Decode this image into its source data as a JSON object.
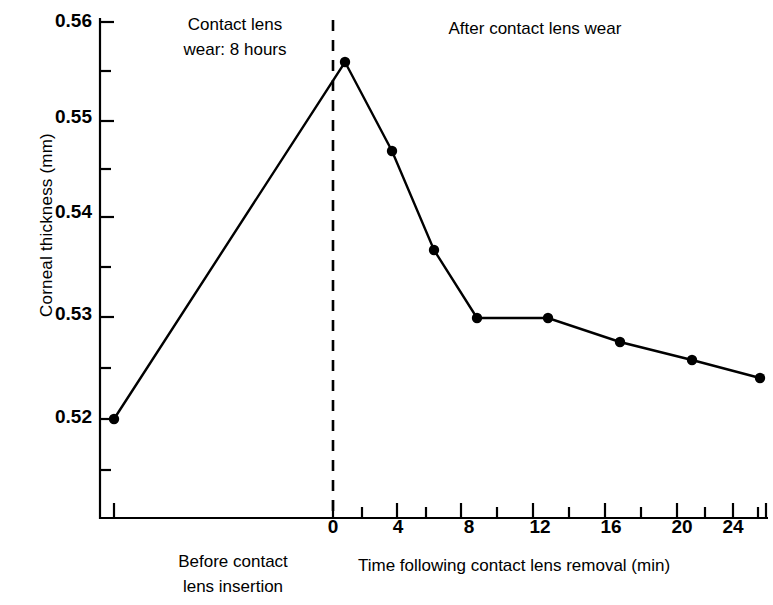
{
  "chart_data": {
    "type": "line",
    "title": "",
    "xlabel": "Time following contact lens removal (min)",
    "ylabel": "Corneal thickness (mm)",
    "xlim": [
      -14,
      30
    ],
    "ylim": [
      0.5145,
      0.5605
    ],
    "grid": false,
    "legend": null,
    "x_ticks": [
      0,
      2,
      4,
      6,
      8,
      10,
      12,
      14,
      16,
      18,
      20,
      22,
      24,
      26,
      28,
      30
    ],
    "x_tick_labels": [
      "0",
      "",
      "4",
      "",
      "8",
      "",
      "12",
      "",
      "16",
      "",
      "20",
      "",
      "24",
      "",
      "28",
      ""
    ],
    "y_ticks": [
      0.52,
      0.525,
      0.53,
      0.535,
      0.54,
      0.545,
      0.55,
      0.555,
      0.56
    ],
    "y_tick_labels": [
      "0.52",
      "",
      "0.53",
      "",
      "0.54",
      "",
      "0.55",
      "",
      "0.56"
    ],
    "y_major_labels": [
      "0.56",
      "0.55",
      "0.54",
      "0.53",
      "0.52"
    ],
    "baseline_point": {
      "label": "Before contact lens insertion",
      "x": -13,
      "y": 0.5199
    },
    "series": [
      {
        "name": "Corneal thickness",
        "x": [
          -13,
          1,
          4,
          7,
          10,
          14,
          18,
          22,
          26
        ],
        "y": [
          0.5199,
          0.556,
          0.5466,
          0.5365,
          0.5299,
          0.5299,
          0.5272,
          0.5256,
          0.5237
        ],
        "marker": "filled-circle",
        "color": "#000000"
      }
    ],
    "annotations": [
      {
        "name": "contact-lens-wear-note",
        "text": "Contact lens\nwear: 8 hours",
        "x": -8,
        "y": 0.5588
      },
      {
        "name": "after-wear-note",
        "text": "After contact lens wear",
        "x": 14,
        "y": 0.5588
      },
      {
        "name": "before-insertion-caption",
        "text": "Before contact\nlens insertion",
        "x": -9,
        "y": null
      }
    ],
    "reference_line": {
      "name": "lens-removal-line",
      "x": 0,
      "style": "dashed",
      "color": "#000000"
    }
  },
  "axes": {
    "y_axis_label": "Corneal thickness (mm)",
    "x_axis_label": "Time following contact lens removal (min)"
  },
  "labels": {
    "y0": "0.56",
    "y1": "0.55",
    "y2": "0.54",
    "y3": "0.53",
    "y4": "0.52",
    "x0": "0",
    "x4": "4",
    "x8": "8",
    "x12": "12",
    "x16": "16",
    "x20": "20",
    "x24": "24",
    "x28": "28"
  },
  "notes": {
    "wear": "Contact lens\nwear: 8 hours",
    "after": "After contact lens wear",
    "before": "Before contact\nlens insertion"
  },
  "colors": {
    "line": "#000000",
    "marker": "#000000",
    "axis": "#000000",
    "background": "#ffffff"
  }
}
